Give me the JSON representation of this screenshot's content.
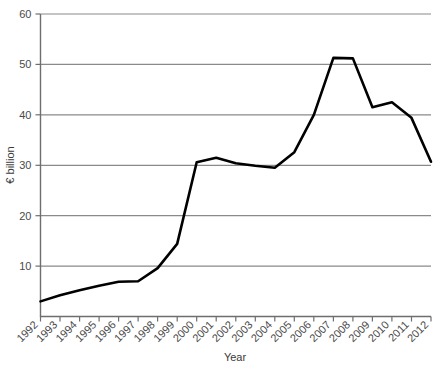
{
  "chart_data": {
    "type": "line",
    "title": "",
    "xlabel": "Year",
    "ylabel": "€ billion",
    "xlim": [
      1992,
      2012
    ],
    "ylim": [
      0,
      60
    ],
    "yticks": [
      0,
      10,
      20,
      30,
      40,
      50,
      60
    ],
    "ytick_labels": [
      "",
      "10",
      "20",
      "30",
      "40",
      "50",
      "60"
    ],
    "grid": "horizontal",
    "legend": "none",
    "line_color": "#000000",
    "grid_color": "#8a8a8a",
    "axis_color": "#6e6e6e",
    "categories": [
      "1992",
      "1993",
      "1994",
      "1995",
      "1996",
      "1997",
      "1998",
      "1999",
      "2000",
      "2001",
      "2002",
      "2003",
      "2004",
      "2005",
      "2006",
      "2007",
      "2008",
      "2009",
      "2010",
      "2011",
      "2012"
    ],
    "series": [
      {
        "name": "€ billion",
        "values": [
          3.0,
          4.2,
          5.2,
          6.1,
          6.9,
          7.0,
          9.6,
          14.4,
          30.6,
          31.5,
          30.4,
          29.9,
          29.5,
          32.6,
          40.0,
          51.3,
          51.2,
          41.5,
          42.5,
          39.4,
          30.7
        ]
      }
    ]
  }
}
